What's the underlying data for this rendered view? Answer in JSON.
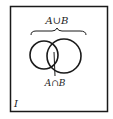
{
  "diagram": {
    "type": "venn",
    "universal_set_label": "I",
    "union_label": "A∪B",
    "intersection_label": "A∩B",
    "sets": [
      "A",
      "B"
    ],
    "colors": {
      "stroke": "#1a1a1a",
      "background": "#ffffff"
    }
  }
}
